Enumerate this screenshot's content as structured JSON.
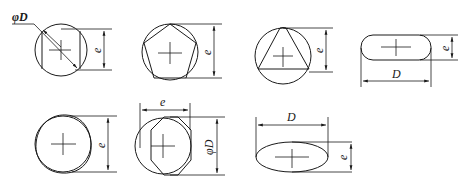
{
  "diagram": {
    "title": "",
    "figures": [
      {
        "id": "fig1",
        "shape": "circle-with-square-cross",
        "labels": {
          "diameter": "φD",
          "height": "e"
        }
      },
      {
        "id": "fig2",
        "shape": "circle-with-inscribed-pentagon",
        "labels": {
          "height": "e"
        }
      },
      {
        "id": "fig3",
        "shape": "circle-with-inscribed-triangle",
        "labels": {
          "height": "e"
        }
      },
      {
        "id": "fig4",
        "shape": "slot-rounded-rectangle",
        "labels": {
          "width": "D",
          "height": "e"
        }
      },
      {
        "id": "fig5",
        "shape": "double-circle-lobed",
        "labels": {
          "height": "e"
        }
      },
      {
        "id": "fig6",
        "shape": "circle-with-hexagon-flats",
        "labels": {
          "width": "e",
          "height": "φD"
        }
      },
      {
        "id": "fig7",
        "shape": "ellipse",
        "labels": {
          "width": "D",
          "height": "e"
        }
      }
    ]
  },
  "labels": {
    "f1_phiD": "φD",
    "f1_e": "e",
    "f2_e": "e",
    "f3_e": "e",
    "f4_D": "D",
    "f4_e": "e",
    "f5_e": "e",
    "f6_e": "e",
    "f6_phiD": "φD",
    "f7_D": "D",
    "f7_e": "e"
  },
  "colors": {
    "line": "#1a1a1a",
    "background": "#ffffff"
  }
}
